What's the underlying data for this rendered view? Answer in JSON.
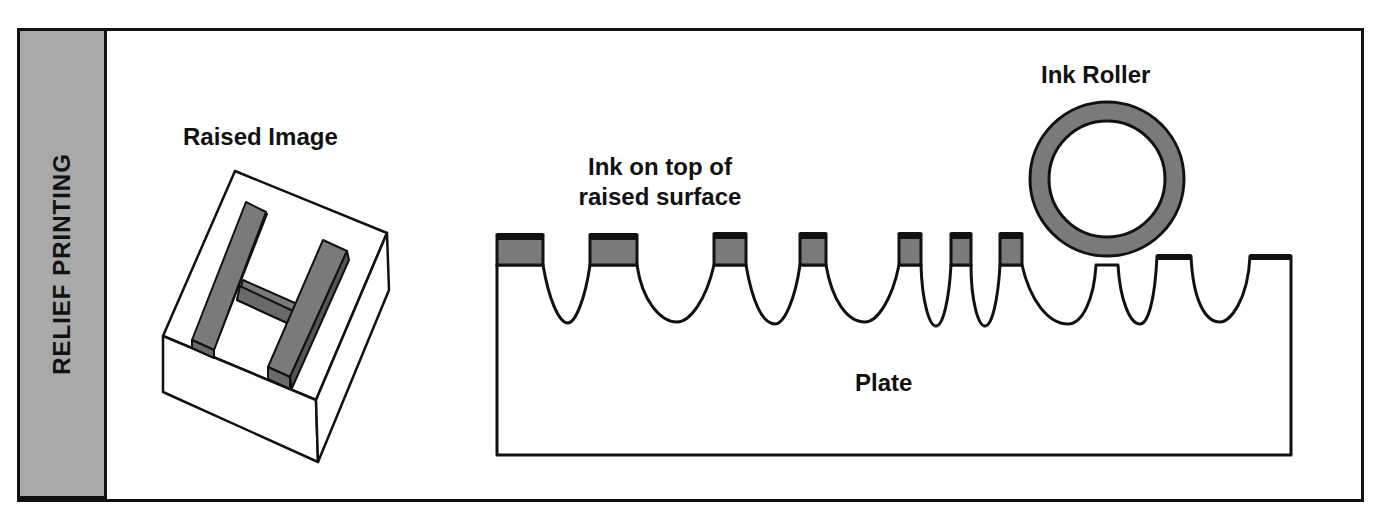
{
  "sidebar": {
    "title": "RELIEF PRINTING"
  },
  "labels": {
    "raised_image": "Raised Image",
    "ink_on_top_line1": "Ink on top of",
    "ink_on_top_line2": "raised surface",
    "ink_roller": "Ink Roller",
    "plate": "Plate"
  },
  "block_letter": "H",
  "colors": {
    "ink_gray": "#7a7a7a",
    "sidebar_gray": "#a9a9a9",
    "line": "#111111"
  }
}
